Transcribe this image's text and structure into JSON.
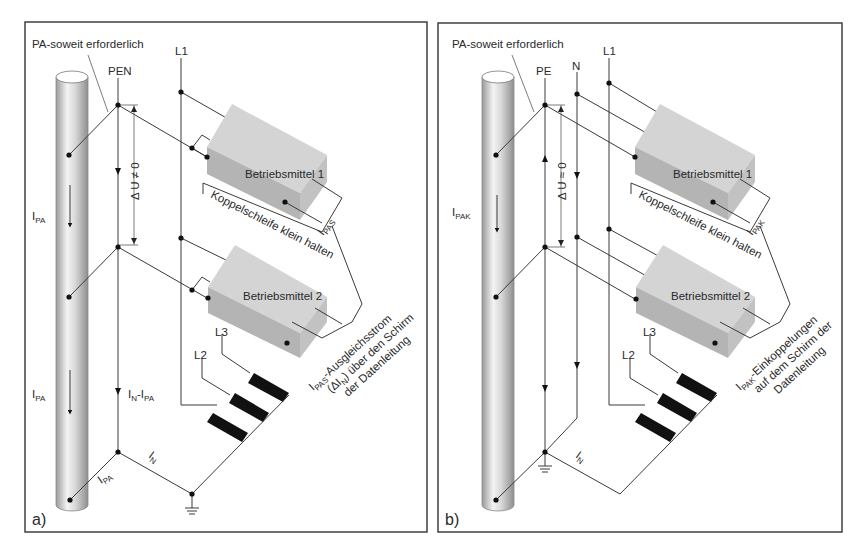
{
  "figure": {
    "panels": [
      {
        "id": "a",
        "letter": "a)",
        "pa_note": "PA-soweit erforderlich",
        "conductor_pen": "PEN",
        "conductor_l1": "L1",
        "conductor_l2": "L2",
        "conductor_l3": "L3",
        "voltage_label": "Δ U ≠ 0",
        "current_pole_upper": {
          "main": "I",
          "sub": "PA"
        },
        "current_pole_lower": {
          "main": "I",
          "sub": "PA"
        },
        "current_pen": {
          "main": "I",
          "sub1": "N",
          "dash": "-I",
          "sub2": "PA"
        },
        "current_ground_branch": {
          "main": "I",
          "sub": "PA"
        },
        "current_neutral": {
          "main": "I",
          "sub": "N"
        },
        "current_loop": {
          "main": "I",
          "sub": "PAS"
        },
        "device_1": "Betriebsmittel 1",
        "device_2": "Betriebsmittel 2",
        "loop_note": "Koppelschleife klein halten",
        "shield_note": {
          "line1_main": "I",
          "line1_sub": "PAS",
          "line1_rest": "-Ausgleichsstrom",
          "line2": "(ΔI",
          "line2_sub": "N",
          "line2_rest": ") über den Schirm",
          "line3": "der Datenleitung"
        }
      },
      {
        "id": "b",
        "letter": "b)",
        "pa_note": "PA-soweit erforderlich",
        "conductor_pe": "PE",
        "conductor_n": "N",
        "conductor_l1": "L1",
        "conductor_l2": "L2",
        "conductor_l3": "L3",
        "voltage_label": "Δ U ≈ 0",
        "current_pole": {
          "main": "I",
          "sub": "PAK"
        },
        "current_neutral": {
          "main": "I",
          "sub": "N"
        },
        "current_loop": {
          "main": "I",
          "sub": "PAK"
        },
        "device_1": "Betriebsmittel 1",
        "device_2": "Betriebsmittel 2",
        "loop_note": "Koppelschleife klein halten",
        "shield_note": {
          "line1_main": "I",
          "line1_sub": "PAK",
          "line1_rest": "-Einkoppelungen",
          "line2": "auf dem Schirm der",
          "line3": "Datenleitung"
        }
      }
    ],
    "colors": {
      "frame": "#333333",
      "wire": "#3a3a3a",
      "box_top": "#d4d4d4",
      "box_front": "#b4b4b4",
      "box_side": "#c2c2c2",
      "winding": "#111111",
      "pole_dark": "#9a9a9a",
      "pole_light": "#f4f4f4"
    }
  }
}
